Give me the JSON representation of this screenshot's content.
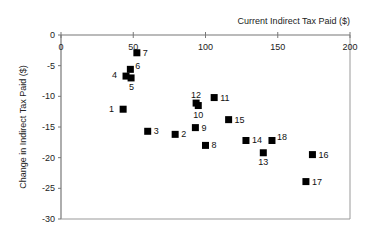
{
  "chart_data": {
    "type": "scatter",
    "title": "",
    "xlabel": "Current Indirect Tax Paid ($)",
    "ylabel": "Change in Indirect Tax Paid ($)",
    "xlim": [
      0,
      200
    ],
    "ylim": [
      -30,
      0
    ],
    "xticks": [
      0,
      50,
      100,
      150,
      200
    ],
    "yticks": [
      0,
      -5,
      -10,
      -15,
      -20,
      -25,
      -30
    ],
    "grid": false,
    "legend": null,
    "marker": "square",
    "marker_color": "#000000",
    "points": [
      {
        "label": "1",
        "x": 43,
        "y": -12.1,
        "lx": -9,
        "ly": 3
      },
      {
        "label": "2",
        "x": 79,
        "y": -16.2,
        "lx": 6,
        "ly": 3
      },
      {
        "label": "3",
        "x": 60,
        "y": -15.7,
        "lx": 6,
        "ly": 3
      },
      {
        "label": "4",
        "x": 45,
        "y": -6.7,
        "lx": -9,
        "ly": 2
      },
      {
        "label": "5",
        "x": 48.5,
        "y": -7.0,
        "lx": -2,
        "ly": 12
      },
      {
        "label": "6",
        "x": 48,
        "y": -5.6,
        "lx": 5,
        "ly": 0
      },
      {
        "label": "7",
        "x": 52.5,
        "y": -2.9,
        "lx": 6,
        "ly": 3
      },
      {
        "label": "8",
        "x": 100,
        "y": -18.0,
        "lx": 6,
        "ly": 3
      },
      {
        "label": "9",
        "x": 93,
        "y": -15.1,
        "lx": 6,
        "ly": 3
      },
      {
        "label": "10",
        "x": 95,
        "y": -11.5,
        "lx": -5,
        "ly": 12
      },
      {
        "label": "11",
        "x": 106,
        "y": -10.2,
        "lx": 6,
        "ly": 3
      },
      {
        "label": "12",
        "x": 93.5,
        "y": -11.1,
        "lx": -5,
        "ly": -5
      },
      {
        "label": "13",
        "x": 140,
        "y": -19.2,
        "lx": -5,
        "ly": 12
      },
      {
        "label": "14",
        "x": 128,
        "y": -17.2,
        "lx": 6,
        "ly": 3
      },
      {
        "label": "15",
        "x": 116,
        "y": -13.8,
        "lx": 6,
        "ly": 3
      },
      {
        "label": "16",
        "x": 174,
        "y": -19.5,
        "lx": 6,
        "ly": 3
      },
      {
        "label": "17",
        "x": 169.5,
        "y": -23.9,
        "lx": 6,
        "ly": 3
      },
      {
        "label": "18",
        "x": 146,
        "y": -17.2,
        "lx": 5,
        "ly": 0
      }
    ]
  }
}
